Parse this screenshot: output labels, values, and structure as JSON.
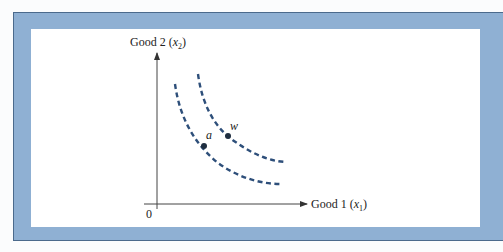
{
  "figure": {
    "y_axis_label": "Good 2 (",
    "y_axis_var": "x",
    "y_axis_sub": "2",
    "y_axis_close": ")",
    "x_axis_label": "Good 1 (",
    "x_axis_var": "x",
    "x_axis_sub": "1",
    "x_axis_close": ")",
    "origin_label": "0",
    "points": [
      {
        "label": "a",
        "curve": "inner"
      },
      {
        "label": "w",
        "curve": "outer"
      }
    ],
    "curves": [
      {
        "name": "inner indifference curve",
        "style": "dashed"
      },
      {
        "name": "outer indifference curve",
        "style": "dashed"
      }
    ],
    "colors": {
      "frame": "#8fb0d3",
      "frame_border": "#4b6a8c",
      "curve": "#2e4f7a",
      "axis": "#333333"
    }
  }
}
